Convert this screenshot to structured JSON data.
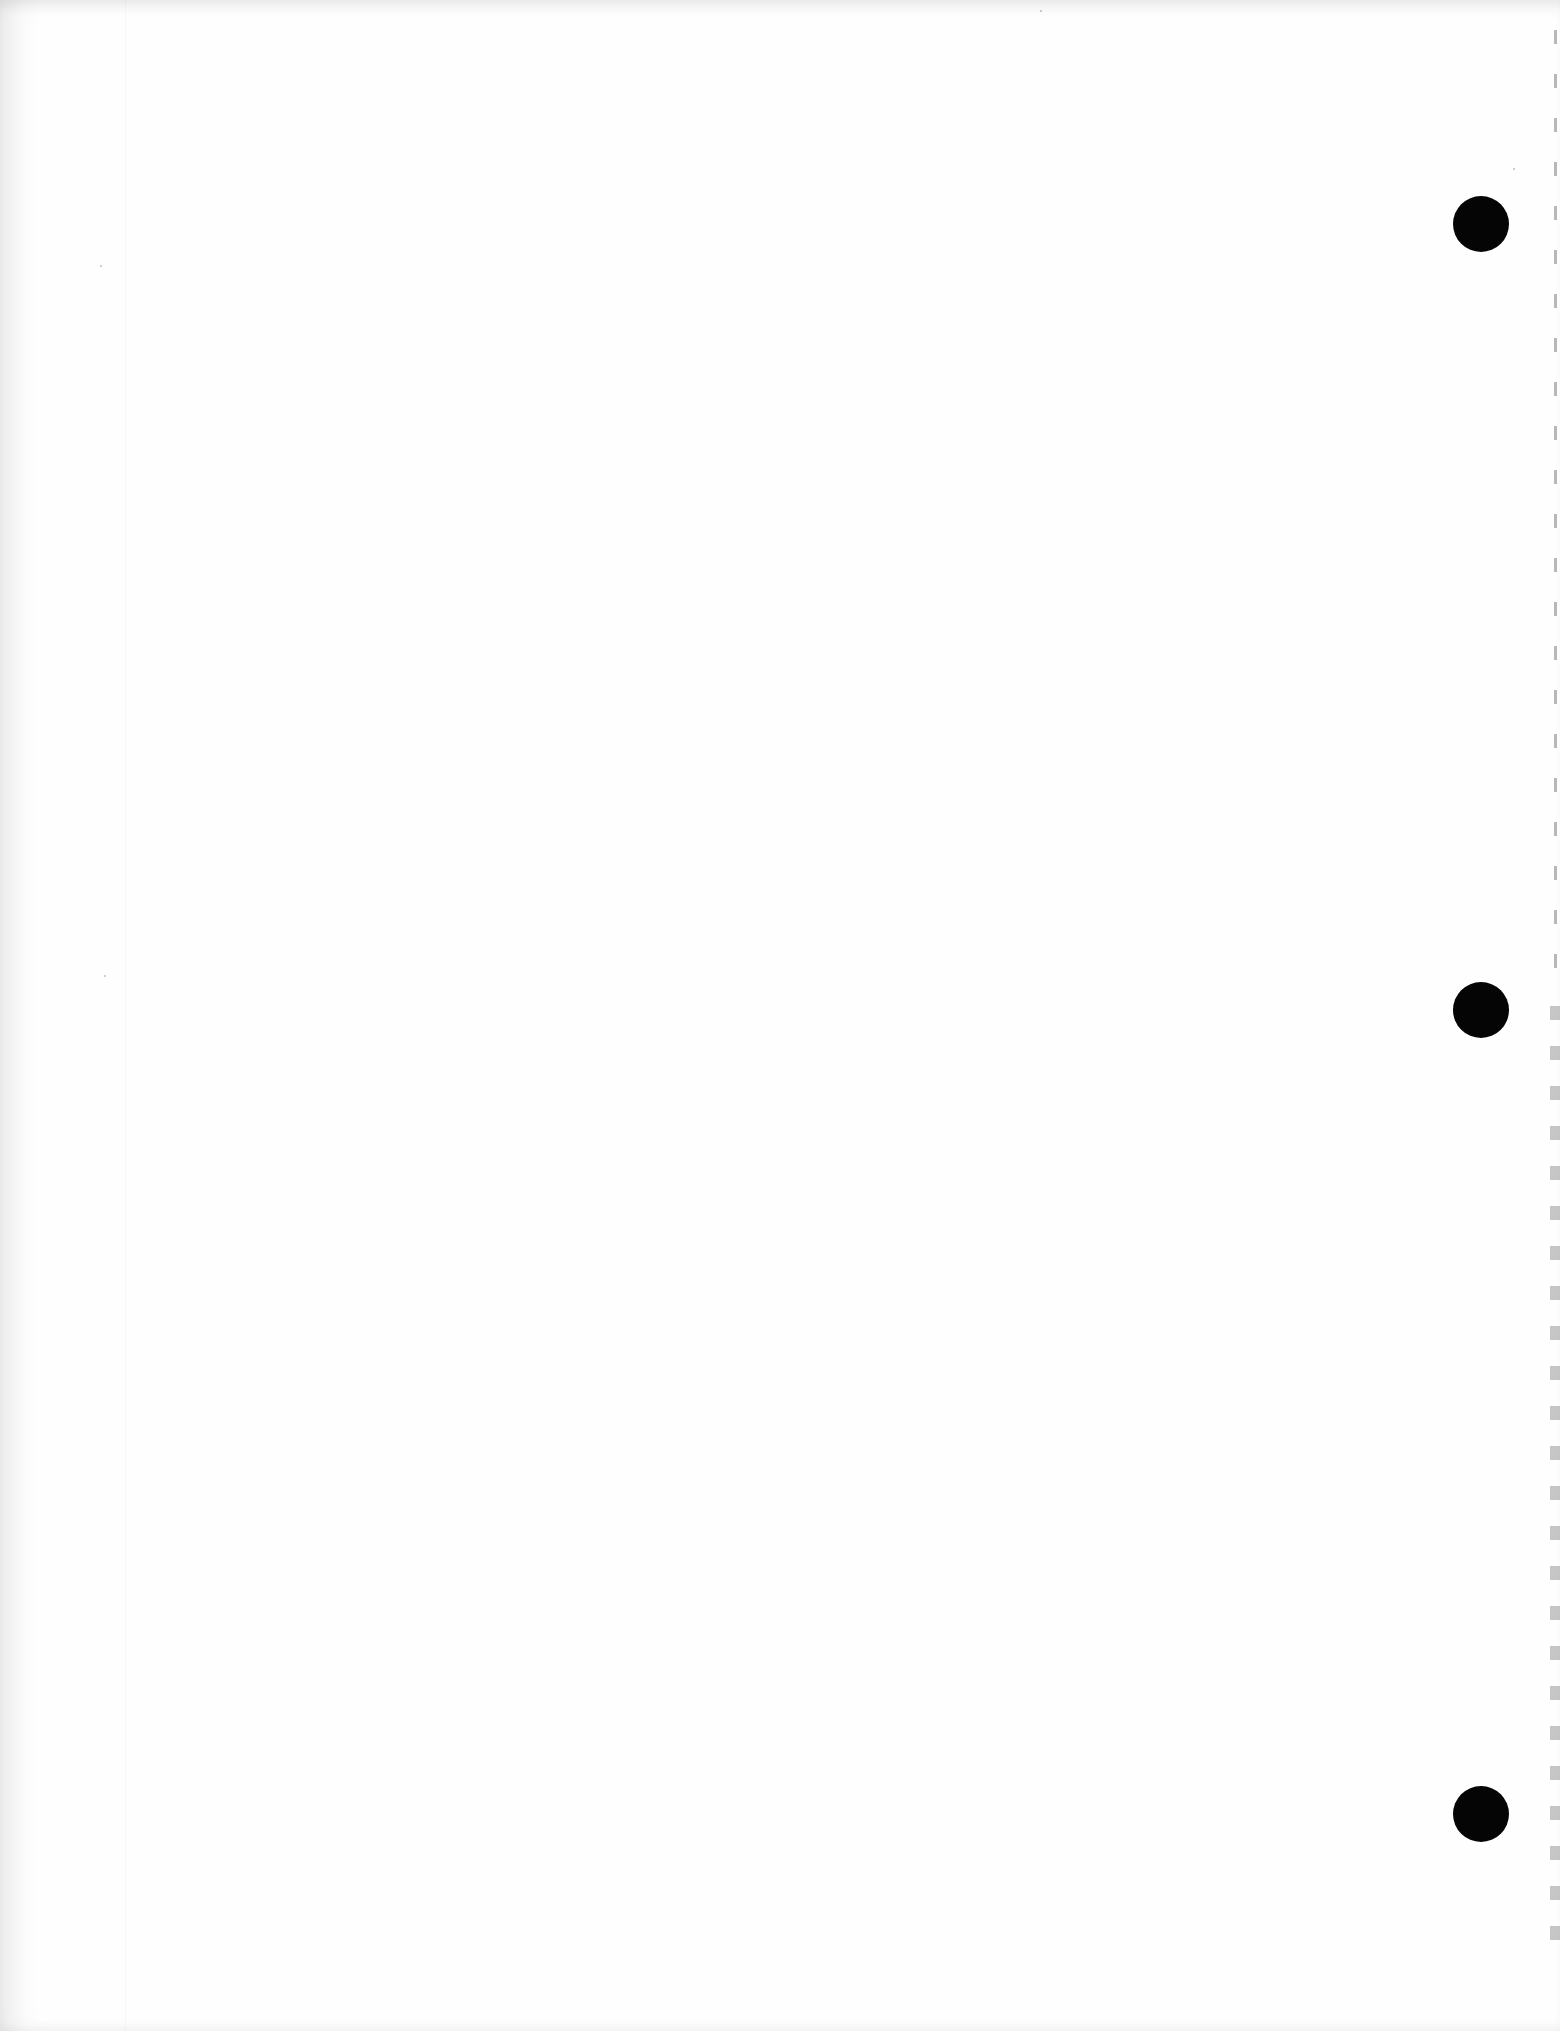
{
  "document": {
    "type": "blank scanned page",
    "text_content": "",
    "punch_holes": [
      {
        "name": "top",
        "cx": 1481,
        "cy": 224,
        "diameter": 56
      },
      {
        "name": "middle",
        "cx": 1481,
        "cy": 1010,
        "diameter": 56
      },
      {
        "name": "bottom",
        "cx": 1481,
        "cy": 1814,
        "diameter": 56
      }
    ],
    "colors": {
      "paper": "#fefefe",
      "hole": "#050505",
      "scan_shadow": "#e6e6e6"
    }
  }
}
